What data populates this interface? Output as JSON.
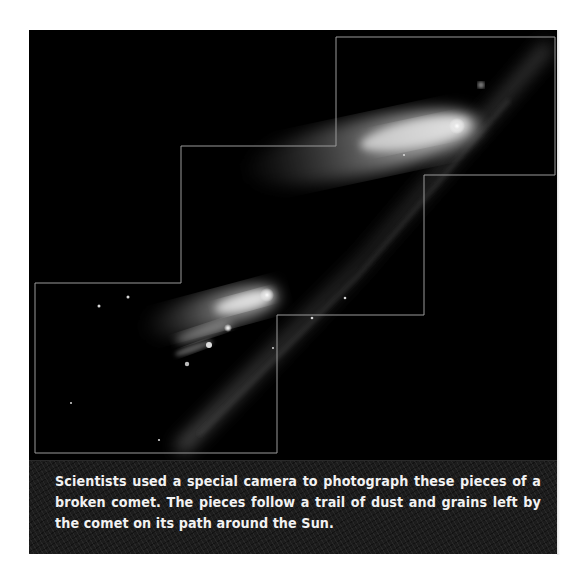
{
  "figure": {
    "image": {
      "subject": "broken-comet-fragments",
      "background_color": "#000000",
      "frame_line_color": "#9a9a9a"
    },
    "caption": {
      "text": "Scientists used a special camera to photograph these pieces of a broken comet.  The pieces follow a trail of dust and grains left by the comet on its path around the Sun.",
      "text_color": "#f2f2f2",
      "background_color": "#1c1c1c"
    }
  }
}
